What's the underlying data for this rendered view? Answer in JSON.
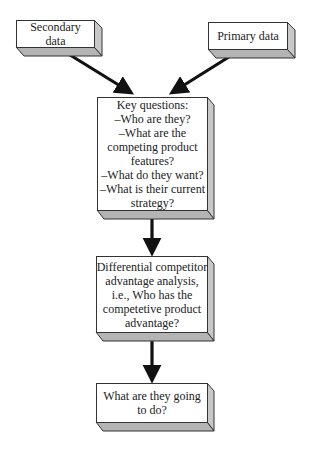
{
  "diagram": {
    "nodes": {
      "secondary": {
        "label": "Secondary data"
      },
      "primary": {
        "label": "Primary data"
      },
      "key": {
        "lines": [
          "Key questions:",
          "–Who are they?",
          "–What are the",
          "competing product",
          "features?",
          "–What do they want?",
          "–What is their current",
          "strategy?"
        ]
      },
      "differential": {
        "lines": [
          "Differential competitor",
          "advantage analysis,",
          "i.e., Who has the",
          "competetive product",
          "advantage?"
        ]
      },
      "future": {
        "lines": [
          "What are they going",
          "to do?"
        ]
      }
    },
    "edges": [
      {
        "from": "secondary",
        "to": "key"
      },
      {
        "from": "primary",
        "to": "key"
      },
      {
        "from": "key",
        "to": "differential"
      },
      {
        "from": "differential",
        "to": "future"
      }
    ],
    "colors": {
      "face": "#ffffff",
      "side": "#c8c8c8",
      "bottom": "#b4b4b4",
      "stroke": "#333333",
      "arrow": "#111111"
    }
  }
}
